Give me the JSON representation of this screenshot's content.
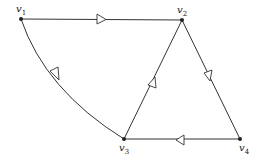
{
  "diagram": {
    "type": "directed-graph",
    "nodes": [
      {
        "id": "v1",
        "label": "v",
        "sub": "1",
        "x": 21,
        "y": 19
      },
      {
        "id": "v2",
        "label": "v",
        "sub": "2",
        "x": 182,
        "y": 20
      },
      {
        "id": "v3",
        "label": "v",
        "sub": "3",
        "x": 124,
        "y": 139
      },
      {
        "id": "v4",
        "label": "v",
        "sub": "4",
        "x": 240,
        "y": 139
      }
    ],
    "edges": [
      {
        "from": "v1",
        "to": "v2",
        "curved": false
      },
      {
        "from": "v1",
        "to": "v3",
        "curved": true
      },
      {
        "from": "v3",
        "to": "v2",
        "curved": false
      },
      {
        "from": "v2",
        "to": "v4",
        "curved": false
      },
      {
        "from": "v4",
        "to": "v3",
        "curved": false
      }
    ],
    "colors": {
      "line": "#333333",
      "background": "#ffffff"
    }
  }
}
